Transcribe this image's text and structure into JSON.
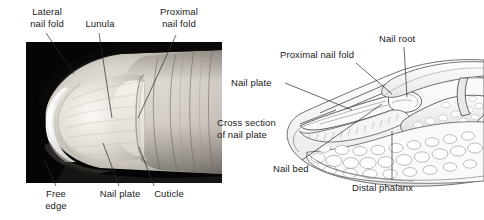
{
  "figure": {
    "panels": [
      {
        "id": "photograph",
        "kind": "photograph",
        "description": "Grayscale dorsal photograph of a fingertip and nail on black background",
        "labels": [
          {
            "name": "lateral-nail-fold",
            "text": "Lateral\nnail fold"
          },
          {
            "name": "lunula",
            "text": "Lunula"
          },
          {
            "name": "proximal-nail-fold",
            "text": "Proximal\nnail fold"
          },
          {
            "name": "free-edge",
            "text": "Free\nedge"
          },
          {
            "name": "nail-plate",
            "text": "Nail plate"
          },
          {
            "name": "cuticle",
            "text": "Cuticle"
          }
        ]
      },
      {
        "id": "sagittal-section",
        "kind": "line-drawing",
        "description": "Sagittal section line drawing through the distal fingertip showing nail root, nail bed and distal phalanx",
        "labels": [
          {
            "name": "nail-root",
            "text": "Nail root"
          },
          {
            "name": "proximal-nail-fold",
            "text": "Proximal nail fold"
          },
          {
            "name": "nail-plate",
            "text": "Nail plate"
          },
          {
            "name": "cross-section-of-nail-plate",
            "text": "Cross section\nof nail plate"
          },
          {
            "name": "nail-bed",
            "text": "Nail bed"
          },
          {
            "name": "distal-phalanx",
            "text": "Distal phalanx"
          }
        ]
      }
    ]
  },
  "colors": {
    "background": "#ffffff",
    "text": "#1a1a1a",
    "leader_line": "#2b2b2b",
    "photo_background": "#050505",
    "drawing_ink": "#555555"
  }
}
